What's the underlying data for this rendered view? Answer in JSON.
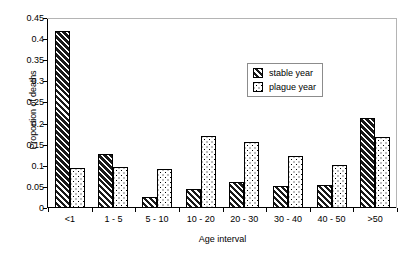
{
  "chart_data": {
    "type": "bar",
    "title": "",
    "xlabel": "Age interval",
    "ylabel": "Proportion of deaths",
    "categories": [
      "<1",
      "1 - 5",
      "5 - 10",
      "10 - 20",
      "20 - 30",
      "30 - 40",
      "40 - 50",
      ">50"
    ],
    "series": [
      {
        "name": "stable year",
        "values": [
          0.42,
          0.127,
          0.025,
          0.045,
          0.061,
          0.052,
          0.055,
          0.213
        ],
        "fill": "black-diagonal-hatch",
        "color": "#1a1a1a"
      },
      {
        "name": "plague year",
        "values": [
          0.094,
          0.097,
          0.092,
          0.17,
          0.157,
          0.123,
          0.102,
          0.168
        ],
        "fill": "white-dotted",
        "color": "#ffffff"
      }
    ],
    "ylim": [
      0,
      0.45
    ],
    "ytick_step": 0.05,
    "yticks": [
      "0",
      "0.05",
      "0.1",
      "0.15",
      "0.2",
      "0.25",
      "0.3",
      "0.35",
      "0.4",
      "0.45"
    ],
    "grid": false,
    "legend_position": "upper-center-right"
  },
  "legend": {
    "items": [
      {
        "label": "stable year"
      },
      {
        "label": "plague year"
      }
    ]
  },
  "axes": {
    "y_title": "Proportion of deaths",
    "x_title": "Age interval"
  }
}
